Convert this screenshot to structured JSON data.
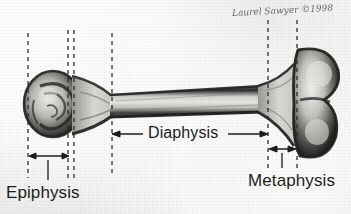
{
  "figure": {
    "medium": "pencil illustration on textured paper",
    "background_color": "#f1f1ef",
    "ink_color": "#1e1e1e"
  },
  "signature": {
    "text": "Laurel Sawyer ©1998",
    "name": "Laurel Sawyer",
    "year": "1998",
    "symbol": "©"
  },
  "labels": {
    "epiphysis": "Epiphysis",
    "diaphysis": "Diaphysis",
    "metaphysis": "Metaphysis"
  },
  "bone": {
    "type": "long bone (femur)",
    "left_end": "rounded proximal epiphysis (head)",
    "right_end": "bilobed distal epiphysis (condyles)",
    "shaft": "diaphysis"
  },
  "guides": [
    {
      "name": "epiphysis-outer-line",
      "x": 28,
      "style": "dashed"
    },
    {
      "name": "growth-plate-line-a",
      "x": 68,
      "style": "dashed"
    },
    {
      "name": "growth-plate-line-b",
      "x": 74,
      "style": "dashed"
    },
    {
      "name": "diaphysis-start-line",
      "x": 112,
      "style": "dashed"
    },
    {
      "name": "diaphysis-end-line",
      "x": 268,
      "style": "dashed"
    },
    {
      "name": "metaphysis-end-line",
      "x": 297,
      "style": "dashed"
    }
  ],
  "measures": [
    {
      "name": "epiphysis-span",
      "from": 28,
      "to": 70,
      "y": 156
    },
    {
      "name": "diaphysis-span",
      "from": 112,
      "to": 268,
      "y": 134
    },
    {
      "name": "metaphysis-span",
      "from": 268,
      "to": 297,
      "y": 149
    }
  ]
}
